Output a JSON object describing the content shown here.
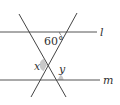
{
  "diagram": {
    "lines": {
      "l": {
        "label": "l",
        "y": 32,
        "x1": 0,
        "x2": 97
      },
      "m": {
        "label": "m",
        "y": 80,
        "x1": 0,
        "x2": 100
      },
      "t1": {
        "x1": 19,
        "y1": 14,
        "x2": 66,
        "y2": 97
      },
      "t2": {
        "x1": 77,
        "y1": 13,
        "x2": 31,
        "y2": 97
      }
    },
    "angles": {
      "given": {
        "label": "60°",
        "value": 60
      },
      "x": {
        "label": "x"
      },
      "y": {
        "label": "y"
      }
    },
    "colors": {
      "line": "#444444",
      "arc_fill": "#c8c8c8",
      "text": "#333333"
    }
  }
}
